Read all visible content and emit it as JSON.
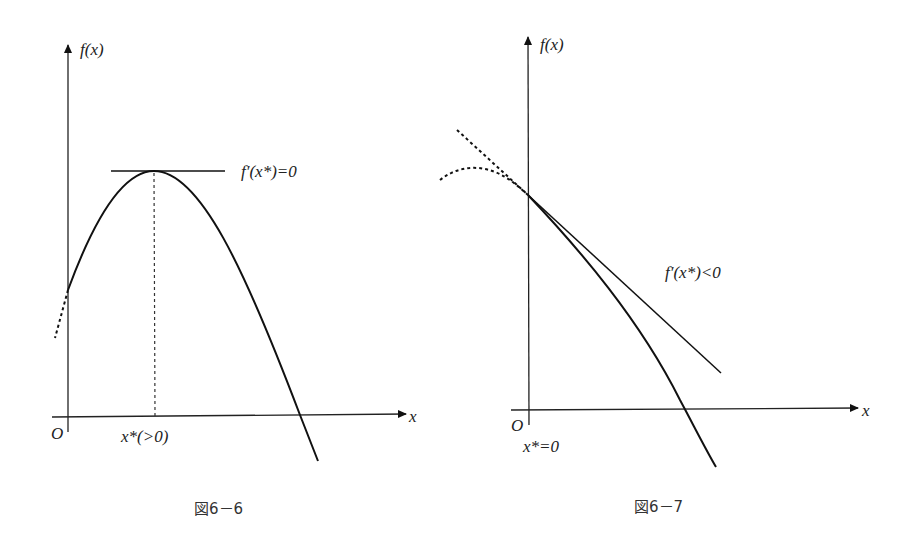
{
  "figures": [
    {
      "id": "fig-6-6",
      "caption": "図6－6",
      "y_axis_label": "f(x)",
      "x_axis_label": "x",
      "origin_label": "O",
      "tangent_label": "f′(x*)=0",
      "x_star_label": "x*(>0)",
      "description": "Concave curve with interior maximum at x* > 0; horizontal tangent at the peak"
    },
    {
      "id": "fig-6-7",
      "caption": "図6－7",
      "y_axis_label": "f(x)",
      "x_axis_label": "x",
      "origin_label": "O",
      "tangent_label": "f′(x*)<0",
      "x_star_label": "x*=0",
      "description": "Concave curve decreasing at x = 0; corner solution with negative-slope tangent at the origin boundary"
    }
  ]
}
